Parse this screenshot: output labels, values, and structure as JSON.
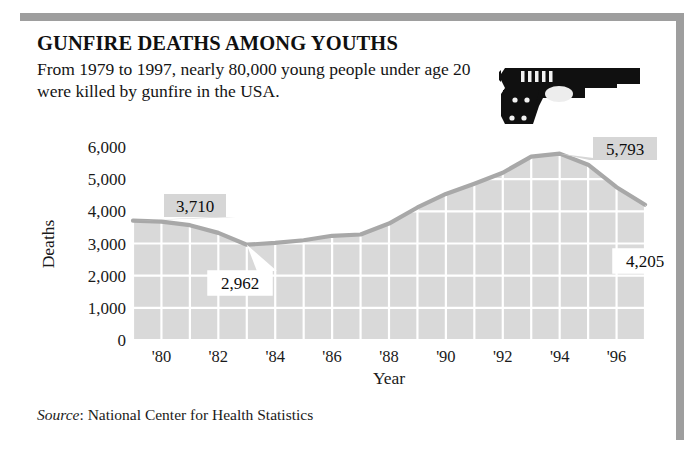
{
  "header": {
    "title": "GUNFIRE DEATHS AMONG YOUTHS",
    "subtitle": "From 1979 to 1997, nearly 80,000 young people under age 20 were killed by gunfire in the USA.",
    "gun_icon_name": "handgun-illustration"
  },
  "source": {
    "label": "Source",
    "separator": ": ",
    "text": "National Center for Health Statistics"
  },
  "chart_data": {
    "type": "area",
    "title": "GUNFIRE DEATHS AMONG YOUTHS",
    "xlabel": "Year",
    "ylabel": "Deaths",
    "xlim": [
      1979,
      1997
    ],
    "ylim": [
      0,
      6000
    ],
    "ytick_values": [
      0,
      1000,
      2000,
      3000,
      4000,
      5000,
      6000
    ],
    "ytick_labels": [
      "0",
      "1,000",
      "2,000",
      "3,000",
      "4,000",
      "5,000",
      "6,000"
    ],
    "xtick_values": [
      1980,
      1982,
      1984,
      1986,
      1988,
      1990,
      1992,
      1994,
      1996
    ],
    "xtick_labels": [
      "'80",
      "'82",
      "'84",
      "'86",
      "'88",
      "'90",
      "'92",
      "'94",
      "'96"
    ],
    "grid": true,
    "legend": "none",
    "fill_color": "#d9d9d9",
    "line_color": "#a8a8a8",
    "gridline_color": "#ffffff",
    "x": [
      1979,
      1980,
      1981,
      1982,
      1983,
      1984,
      1985,
      1986,
      1987,
      1988,
      1989,
      1990,
      1991,
      1992,
      1993,
      1994,
      1995,
      1996,
      1997
    ],
    "values": [
      3710,
      3680,
      3570,
      3330,
      2962,
      3020,
      3100,
      3240,
      3280,
      3620,
      4120,
      4540,
      4860,
      5200,
      5700,
      5793,
      5450,
      4750,
      4205
    ],
    "annotations": [
      {
        "name": "first-point-callout",
        "label": "3,710",
        "year": 1979,
        "value": 3710,
        "style": "gray"
      },
      {
        "name": "minimum-callout",
        "label": "2,962",
        "year": 1983,
        "value": 2962,
        "style": "white"
      },
      {
        "name": "peak-callout",
        "label": "5,793",
        "year": 1994,
        "value": 5793,
        "style": "gray"
      },
      {
        "name": "last-point-callout",
        "label": "4,205",
        "year": 1997,
        "value": 4205,
        "style": "white"
      }
    ]
  }
}
